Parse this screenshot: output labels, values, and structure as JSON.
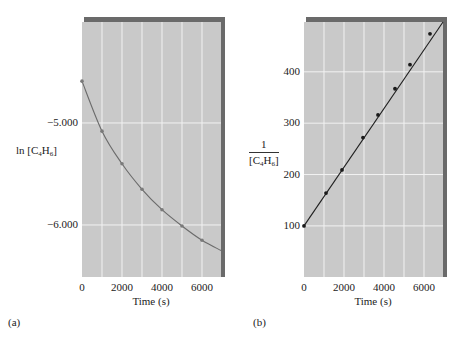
{
  "colors": {
    "plot_bg": "#c9c9c9",
    "grid": "#f2f2f2",
    "shadow": "#6a6a6a",
    "curve_a": "#6b6b6b",
    "point_a": "#7a7a7a",
    "curve_b": "#1f1f1f",
    "point_b": "#1a1a1a"
  },
  "panels": {
    "a": {
      "label": "(a)",
      "ylabel_prefix": "ln [C",
      "ylabel_sub1": "4",
      "ylabel_mid": "H",
      "ylabel_sub2": "6",
      "ylabel_suffix": "]",
      "xlabel": "Time (s)",
      "yticks": [
        "−5.000",
        "−6.000"
      ],
      "xticks": [
        "0",
        "2000",
        "4000",
        "6000"
      ]
    },
    "b": {
      "label": "(b)",
      "ylabel_num": "1",
      "ylabel_prefix": "[C",
      "ylabel_sub1": "4",
      "ylabel_mid": "H",
      "ylabel_sub2": "6",
      "ylabel_suffix": "]",
      "xlabel": "Time (s)",
      "yticks": [
        "400",
        "300",
        "200",
        "100"
      ],
      "xticks": [
        "0",
        "2000",
        "4000",
        "6000"
      ]
    }
  },
  "chart_data": [
    {
      "type": "line",
      "panel": "(a)",
      "title": "",
      "xlabel": "Time (s)",
      "ylabel": "ln [C4H6]",
      "x": [
        0,
        1000,
        2000,
        3000,
        4000,
        5000,
        6000
      ],
      "series": [
        {
          "name": "ln [C4H6]",
          "values": [
            -4.59,
            -5.08,
            -5.4,
            -5.65,
            -5.85,
            -6.01,
            -6.15
          ],
          "markers": true,
          "curve_end": {
            "x": 6950,
            "y": -6.25
          }
        }
      ],
      "xticks": [
        0,
        2000,
        4000,
        6000
      ],
      "yticks": [
        -5.0,
        -6.0
      ],
      "xlim": [
        0,
        6950
      ],
      "ylim": [
        -6.51,
        -4.01
      ],
      "grid": true,
      "xgrid_step": 1000,
      "legend": null
    },
    {
      "type": "line",
      "panel": "(b)",
      "title": "",
      "xlabel": "Time (s)",
      "ylabel": "1/[C4H6]",
      "x": [
        0,
        1100,
        1900,
        2950,
        3700,
        4550,
        5300,
        6300
      ],
      "series": [
        {
          "name": "1/[C4H6]",
          "values": [
            100,
            164,
            209,
            272,
            316,
            367,
            414,
            474
          ],
          "markers": true,
          "fit_line": {
            "x0": 0,
            "y0": 100,
            "x1": 6950,
            "y1": 497
          }
        }
      ],
      "xticks": [
        0,
        2000,
        4000,
        6000
      ],
      "yticks": [
        100,
        200,
        300,
        400
      ],
      "xlim": [
        0,
        6950
      ],
      "ylim": [
        0.5,
        497
      ],
      "grid": true,
      "xgrid_step": 1000,
      "legend": null
    }
  ]
}
